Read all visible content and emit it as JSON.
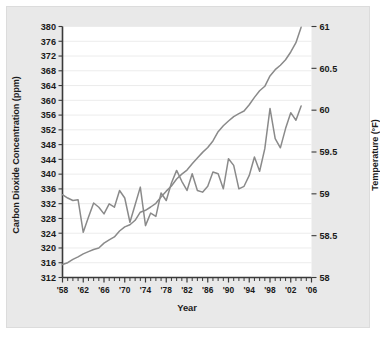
{
  "figure": {
    "background_color": "#e9e9e9",
    "plot_background_color": "#ffffff",
    "axis_color": "#3a3a3a",
    "grid_color": "#ececec"
  },
  "labels": {
    "y_left_title": "Carbon Dioxide Concentration (ppm)",
    "y_right_title": "Temperature (°F)",
    "x_title": "Year"
  },
  "chart_data": {
    "type": "line",
    "title": "",
    "xlabel": "Year",
    "ylabel": "Carbon Dioxide Concentration (ppm)",
    "y2label": "Temperature (°F)",
    "grid": true,
    "legend": "none",
    "xlim": [
      1958,
      2006
    ],
    "ylim": [
      312,
      380
    ],
    "y2lim": [
      58,
      61
    ],
    "xticks": [
      1958,
      1962,
      1966,
      1970,
      1974,
      1978,
      1982,
      1986,
      1990,
      1994,
      1998,
      2002,
      2006
    ],
    "xticklabels": [
      "'58",
      "'62",
      "'66",
      "'70",
      "'74",
      "'78",
      "'82",
      "'86",
      "'90",
      "'94",
      "'98",
      "'02",
      "'06"
    ],
    "xtick_minor_step": 1,
    "yticks": [
      312,
      316,
      320,
      324,
      328,
      332,
      336,
      340,
      344,
      348,
      352,
      356,
      360,
      364,
      368,
      372,
      376,
      380
    ],
    "yticklabels": [
      "312",
      "316",
      "320",
      "324",
      "328",
      "332",
      "336",
      "340",
      "344",
      "348",
      "352",
      "356",
      "360",
      "364",
      "368",
      "372",
      "376",
      "380"
    ],
    "y2ticks": [
      58,
      58.5,
      59,
      59.5,
      60,
      60.5,
      61
    ],
    "y2ticklabels": [
      "58",
      "58.5",
      "59",
      "59.5",
      "60",
      "60.5",
      "61"
    ],
    "series": [
      {
        "name": "Carbon Dioxide Concentration",
        "axis": "left",
        "color": "#8a8a8a",
        "x": [
          1958,
          1959,
          1960,
          1961,
          1962,
          1963,
          1964,
          1965,
          1966,
          1967,
          1968,
          1969,
          1970,
          1971,
          1972,
          1973,
          1974,
          1975,
          1976,
          1977,
          1978,
          1979,
          1980,
          1981,
          1982,
          1983,
          1984,
          1985,
          1986,
          1987,
          1988,
          1989,
          1990,
          1991,
          1992,
          1993,
          1994,
          1995,
          1996,
          1997,
          1998,
          1999,
          2000,
          2001,
          2002,
          2003,
          2004
        ],
        "values": [
          315.5,
          316.0,
          316.9,
          317.6,
          318.4,
          319.0,
          319.6,
          320.0,
          321.3,
          322.2,
          323.0,
          324.6,
          325.7,
          326.3,
          327.5,
          329.7,
          330.2,
          331.1,
          332.1,
          333.8,
          335.4,
          336.8,
          338.7,
          340.0,
          341.1,
          342.8,
          344.4,
          345.9,
          347.2,
          349.0,
          351.5,
          353.1,
          354.4,
          355.6,
          356.4,
          357.1,
          358.8,
          360.8,
          362.6,
          363.8,
          366.6,
          368.3,
          369.5,
          371.0,
          373.1,
          375.6,
          379.8
        ]
      },
      {
        "name": "Temperature",
        "axis": "right",
        "color": "#8a8a8a",
        "x": [
          1958,
          1959,
          1960,
          1961,
          1962,
          1963,
          1964,
          1965,
          1966,
          1967,
          1968,
          1969,
          1970,
          1971,
          1972,
          1973,
          1974,
          1975,
          1976,
          1977,
          1978,
          1979,
          1980,
          1981,
          1982,
          1983,
          1984,
          1985,
          1986,
          1987,
          1988,
          1989,
          1990,
          1991,
          1992,
          1993,
          1994,
          1995,
          1996,
          1997,
          1998,
          1999,
          2000,
          2001,
          2002,
          2003,
          2004
        ],
        "values": [
          58.99,
          58.95,
          58.92,
          58.93,
          58.54,
          58.72,
          58.89,
          58.84,
          58.76,
          58.88,
          58.84,
          59.04,
          58.95,
          58.66,
          58.87,
          59.08,
          58.62,
          58.77,
          58.73,
          59.01,
          58.92,
          59.13,
          59.28,
          59.15,
          59.04,
          59.24,
          59.04,
          59.02,
          59.09,
          59.26,
          59.24,
          59.06,
          59.42,
          59.34,
          59.06,
          59.09,
          59.22,
          59.44,
          59.27,
          59.54,
          60.02,
          59.66,
          59.55,
          59.78,
          59.97,
          59.88,
          60.05
        ]
      }
    ]
  }
}
